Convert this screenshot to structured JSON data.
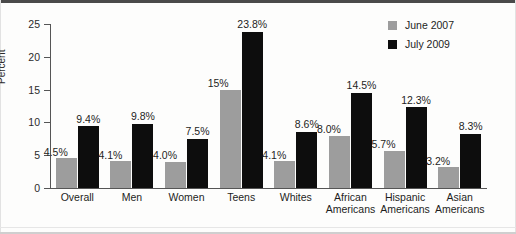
{
  "chart_data": {
    "type": "bar",
    "title": "",
    "xlabel": "",
    "ylabel": "Percent",
    "ylim": [
      0,
      25
    ],
    "yticks": [
      0,
      5,
      10,
      15,
      20,
      25
    ],
    "grid": false,
    "legend_position": "top-right",
    "categories": [
      "Overall",
      "Men",
      "Women",
      "Teens",
      "Whites",
      "African Americans",
      "Hispanic Americans",
      "Asian Americans"
    ],
    "category_lines": [
      [
        "Overall"
      ],
      [
        "Men"
      ],
      [
        "Women"
      ],
      [
        "Teens"
      ],
      [
        "Whites"
      ],
      [
        "African",
        "Americans"
      ],
      [
        "Hispanic",
        "Americans"
      ],
      [
        "Asian",
        "Americans"
      ]
    ],
    "series": [
      {
        "name": "June 2007",
        "color": "#9d9d9d",
        "values": [
          4.5,
          4.1,
          4.0,
          15.0,
          4.1,
          8.0,
          5.7,
          3.2
        ],
        "labels": [
          "4.5%",
          "4.1%",
          "4.0%",
          "15%",
          "4.1%",
          "8.0%",
          "5.7%",
          "3.2%"
        ]
      },
      {
        "name": "July 2009",
        "color": "#0d0d0d",
        "values": [
          9.4,
          9.8,
          7.5,
          23.8,
          8.6,
          14.5,
          12.3,
          8.3
        ],
        "labels": [
          "9.4%",
          "9.8%",
          "7.5%",
          "23.8%",
          "8.6%",
          "14.5%",
          "12.3%",
          "8.3%"
        ]
      }
    ]
  },
  "axis": {
    "tick_labels": [
      "25",
      "20",
      "15",
      "10",
      "5",
      "0"
    ],
    "y_axis_title": "Percent"
  },
  "legend": {
    "items": [
      {
        "label": "June 2007",
        "swatch": "june"
      },
      {
        "label": "July 2009",
        "swatch": "july"
      }
    ]
  }
}
